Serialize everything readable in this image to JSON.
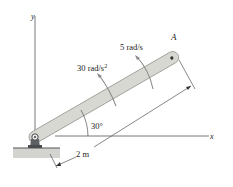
{
  "diagram": {
    "type": "mechanics-rotating-bar",
    "axes": {
      "x_label": "x",
      "y_label": "y"
    },
    "point_label": "A",
    "angular_velocity_label": "5 rad/s",
    "angular_acceleration_label": "30 rad/s",
    "angular_acceleration_exponent": "2",
    "angle_label": "30°",
    "length_label": "2 m",
    "colors": {
      "bar_fill": "#d8d8d2",
      "bar_stroke": "#9a9a94",
      "line": "#444444",
      "ground": "#c9c9c4",
      "pin": "#55585a"
    }
  }
}
